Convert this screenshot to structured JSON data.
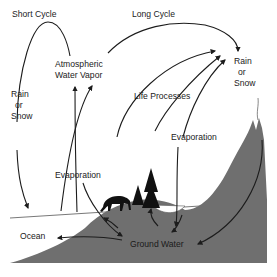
{
  "diagram": {
    "type": "water-cycle",
    "colors": {
      "land": "#6f6f6f",
      "line": "#1c1c1c",
      "background": "#ffffff",
      "text": "#222222"
    },
    "labels": {
      "short_cycle": "Short Cycle",
      "long_cycle": "Long Cycle",
      "atmospheric_line1": "Atmospheric",
      "atmospheric_line2": "Water Vapor",
      "rain_left_1": "Rain",
      "rain_left_2": "or",
      "rain_left_3": "Snow",
      "rain_right_1": "Rain",
      "rain_right_2": "or",
      "rain_right_3": "Snow",
      "life_processes": "Life Processes",
      "evaporation_left": "Evaporation",
      "evaporation_right": "Evaporation",
      "ocean": "Ocean",
      "ground_water": "Ground Water"
    },
    "icons": [
      "deer-silhouette",
      "pine-trees",
      "mountain",
      "arrows"
    ]
  }
}
